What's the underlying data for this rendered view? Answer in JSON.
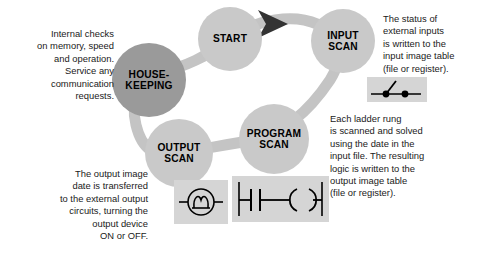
{
  "diagram": {
    "colors": {
      "node_light": "#c9c9c9",
      "node_dark": "#9a9a9a",
      "ring": "#c4c4c4",
      "arrow": "#333333",
      "symbol_box": "#d5d5d5",
      "text": "#1a1a1a"
    },
    "nodes": [
      {
        "id": "start",
        "label": "START"
      },
      {
        "id": "input-scan",
        "label": "INPUT\nSCAN"
      },
      {
        "id": "housekeeping",
        "label": "HOUSE-\nKEEPING"
      },
      {
        "id": "program-scan",
        "label": "PROGRAM\nSCAN"
      },
      {
        "id": "output-scan",
        "label": "OUTPUT\nSCAN"
      }
    ],
    "notes": [
      {
        "id": "housekeeping-note",
        "text": "Internal checks\non memory, speed\nand operation.\nService any\ncommunication\nrequests."
      },
      {
        "id": "input-scan-note",
        "text": "The status of\nexternal inputs\nis written to the\ninput image table\n(file or register)."
      },
      {
        "id": "program-scan-note",
        "text": "Each ladder rung\nis scanned and solved\nusing the date in the\ninput file. The resulting\nlogic is written to the\noutput image table\n(file or register)."
      },
      {
        "id": "output-scan-note",
        "text": "The output image\ndate is transferred\nto the external output\ncircuits, turning the\noutput device\nON or OFF."
      }
    ],
    "symbols": [
      {
        "id": "input-switch-symbol",
        "name": "switch-symbol"
      },
      {
        "id": "output-coil-symbol",
        "name": "coil-symbol"
      },
      {
        "id": "ladder-rung-symbol",
        "name": "ladder-rung-symbol"
      }
    ]
  }
}
